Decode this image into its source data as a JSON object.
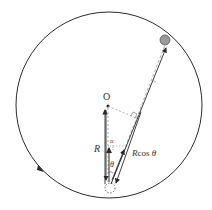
{
  "diagram": {
    "labels": {
      "center": "O",
      "radius": "R",
      "velocity": "u",
      "angle": "θ",
      "projection": "Rcos θ"
    },
    "colors": {
      "stroke": "#2a2a2a",
      "dashed": "#888888",
      "ball": "#9a9a9a"
    }
  }
}
